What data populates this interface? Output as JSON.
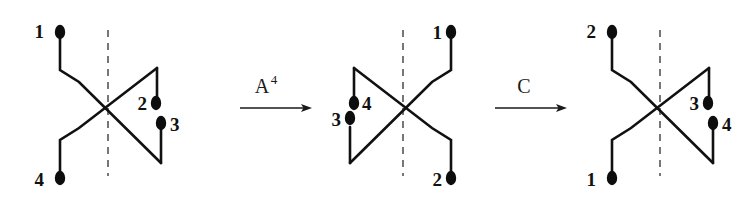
{
  "figure": {
    "background_color": "#ffffff",
    "ink_color": "#111111",
    "axis_color": "#555555",
    "diagram_count": 3,
    "arrow_count": 2
  },
  "diagrams": [
    {
      "id": "diagram-left",
      "name": "left-tangle",
      "axis_label": "symmetry-axis",
      "endpoints": [
        {
          "label": "1",
          "position": "top-left",
          "label_side": "left",
          "cx": 60,
          "cy": 32,
          "lx": 44,
          "ly": 38
        },
        {
          "label": "2",
          "position": "middle-right",
          "label_side": "left",
          "cx": 156,
          "cy": 103,
          "lx": 141,
          "ly": 109
        },
        {
          "label": "3",
          "position": "lower-right",
          "label_side": "right",
          "cx": 161,
          "cy": 123,
          "lx": 172,
          "ly": 131
        },
        {
          "label": "4",
          "position": "bottom-left",
          "label_side": "left",
          "cx": 60,
          "cy": 178,
          "lx": 44,
          "ly": 185
        }
      ]
    },
    {
      "id": "diagram-middle",
      "name": "middle-tangle",
      "axis_label": "symmetry-axis",
      "endpoints": [
        {
          "label": "1",
          "position": "top-right",
          "label_side": "left",
          "cx": 451,
          "cy": 32,
          "lx": 435,
          "ly": 38
        },
        {
          "label": "4",
          "position": "middle-left",
          "label_side": "right",
          "cx": 380,
          "cy": 103,
          "lx": 390,
          "ly": 110
        },
        {
          "label": "3",
          "position": "lower-left",
          "label_side": "left",
          "cx": 360,
          "cy": 113,
          "lx": 344,
          "ly": 121
        },
        {
          "label": "2",
          "position": "bottom-right",
          "label_side": "left",
          "cx": 451,
          "cy": 178,
          "lx": 435,
          "ly": 185
        }
      ]
    },
    {
      "id": "diagram-right",
      "name": "right-tangle",
      "axis_label": "symmetry-axis",
      "endpoints": [
        {
          "label": "2",
          "position": "top-left",
          "label_side": "left",
          "cx": 612,
          "cy": 32,
          "lx": 596,
          "ly": 38
        },
        {
          "label": "3",
          "position": "middle-right",
          "label_side": "left",
          "cx": 708,
          "cy": 103,
          "lx": 693,
          "ly": 109
        },
        {
          "label": "4",
          "position": "lower-right",
          "label_side": "right",
          "cx": 713,
          "cy": 123,
          "lx": 724,
          "ly": 131
        },
        {
          "label": "1",
          "position": "bottom-left",
          "label_side": "left",
          "cx": 612,
          "cy": 178,
          "lx": 596,
          "ly": 185
        }
      ]
    }
  ],
  "arrows": [
    {
      "id": "arrow-a4",
      "name": "arrow-a-power-4",
      "base_label": "A",
      "superscript": "4",
      "x_start": 240,
      "x_end": 312,
      "y": 108,
      "label_x": 262,
      "label_y": 92,
      "sup_x": 275,
      "sup_y": 83
    },
    {
      "id": "arrow-c",
      "name": "arrow-c",
      "base_label": "C",
      "superscript": "",
      "x_start": 495,
      "x_end": 567,
      "y": 108,
      "label_x": 522,
      "label_y": 92,
      "sup_x": 534,
      "sup_y": 83
    }
  ]
}
